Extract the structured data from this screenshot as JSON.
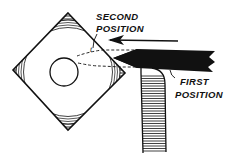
{
  "figure": {
    "type": "line-drawing",
    "colors": {
      "ink": "#111111",
      "background": "#ffffff"
    }
  },
  "labels": {
    "second_position_line1": "SECOND",
    "second_position_line2": "POSITION",
    "first_position_line1": "FIRST",
    "first_position_line2": "POSITION",
    "tool_mark": "t"
  },
  "elements": {
    "workpiece": "square-stock",
    "bore": "center-circle",
    "tool": "cutting-tool",
    "tool_holder": "tool-post",
    "arrow": "feed-direction-arrow-left"
  }
}
